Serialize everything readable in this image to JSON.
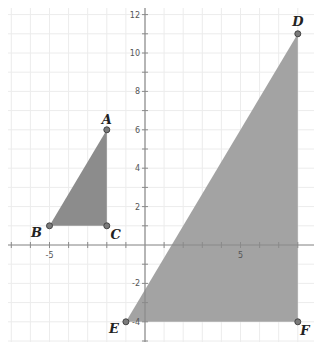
{
  "plot": {
    "origin_px": [
      145,
      245
    ],
    "unit_px": [
      19.1,
      19.2
    ],
    "x_ticks": {
      "min": -7,
      "max": 8,
      "labels": [
        {
          "value": -5,
          "text": "-5"
        },
        {
          "value": 5,
          "text": "5"
        }
      ]
    },
    "y_ticks": {
      "min": -5,
      "max": 12,
      "labels": [
        {
          "value": 12,
          "text": "12"
        },
        {
          "value": 10,
          "text": "10"
        },
        {
          "value": 8,
          "text": "8"
        },
        {
          "value": 6,
          "text": "6"
        },
        {
          "value": 4,
          "text": "4"
        },
        {
          "value": 2,
          "text": "2"
        },
        {
          "value": -2,
          "text": "-2"
        },
        {
          "value": -4,
          "text": "-4"
        }
      ]
    },
    "colors": {
      "small_triangle_fill": "#8c8c8c",
      "large_triangle_fill": "#a3a3a3",
      "grid": "#ececec",
      "axis": "#8a8a8a"
    }
  },
  "triangles": [
    {
      "name": "triangle-ABC",
      "vertices": [
        {
          "label": "A",
          "x": -2,
          "y": 6,
          "label_offset": [
            0,
            -10
          ]
        },
        {
          "label": "B",
          "x": -5,
          "y": 1,
          "label_offset": [
            -13,
            7
          ]
        },
        {
          "label": "C",
          "x": -2,
          "y": 1,
          "label_offset": [
            9,
            9
          ]
        }
      ]
    },
    {
      "name": "triangle-DEF",
      "vertices": [
        {
          "label": "D",
          "x": 8,
          "y": 11,
          "label_offset": [
            0,
            -12
          ]
        },
        {
          "label": "E",
          "x": -1,
          "y": -4,
          "label_offset": [
            -12,
            7
          ]
        },
        {
          "label": "F",
          "x": 8,
          "y": -4,
          "label_offset": [
            7,
            9
          ]
        }
      ]
    }
  ]
}
